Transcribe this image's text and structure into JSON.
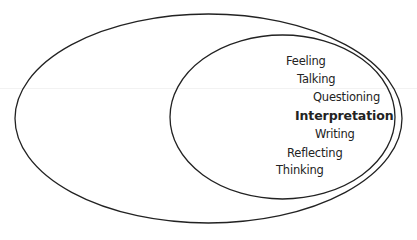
{
  "diagram": {
    "type": "nested-ellipses",
    "stroke_color": "#222222",
    "text_color": "#232323",
    "outer_ellipse": {
      "label": "",
      "cx": 208.5,
      "cy": 118.5,
      "rx": 193.5,
      "ry": 104.5
    },
    "inner_ellipse": {
      "label": "",
      "cx": 282.5,
      "cy": 117,
      "rx": 112.5,
      "ry": 82
    },
    "items": [
      {
        "text": "Feeling",
        "x": 286,
        "y": 56,
        "bold": false
      },
      {
        "text": "Talking",
        "x": 297,
        "y": 74,
        "bold": false
      },
      {
        "text": "Questioning",
        "x": 313,
        "y": 92,
        "bold": false
      },
      {
        "text": "Interpretation",
        "x": 295,
        "y": 110,
        "bold": true
      },
      {
        "text": "Writing",
        "x": 315,
        "y": 129,
        "bold": false
      },
      {
        "text": "Reflecting",
        "x": 287,
        "y": 148,
        "bold": false
      },
      {
        "text": "Thinking",
        "x": 276,
        "y": 165,
        "bold": false
      }
    ]
  }
}
